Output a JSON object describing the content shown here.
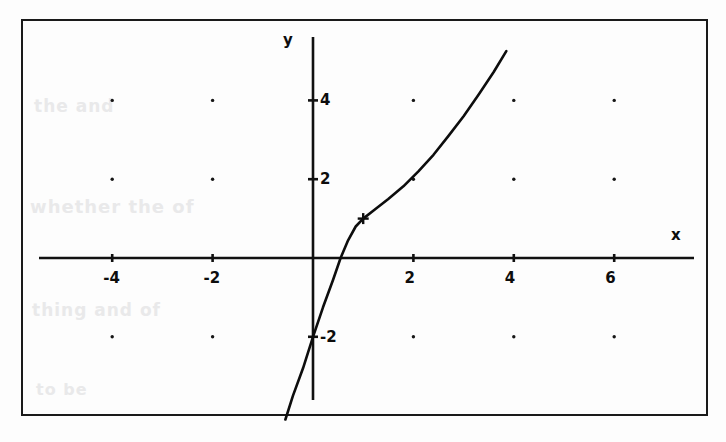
{
  "chart_data": {
    "type": "line",
    "title": "",
    "subtitle": "",
    "xlabel": "x",
    "ylabel": "y",
    "xlim": [
      -5.3,
      7.2
    ],
    "ylim": [
      -4.1,
      5.3
    ],
    "xticks": [
      -4,
      -2,
      2,
      4,
      6
    ],
    "yticks": [
      4,
      2,
      -2
    ],
    "xtick_labels": [
      "-4",
      "-2",
      "2",
      "4",
      "6"
    ],
    "ytick_labels": [
      "4",
      "2",
      "-2"
    ],
    "grid": "dots at even integer lattice points",
    "grid_dots_x": [
      -4,
      -2,
      2,
      4,
      6
    ],
    "grid_dots_y": [
      4,
      2,
      -2
    ],
    "legend": "none",
    "annotations": [
      {
        "label": "kink marker",
        "marker": "plus",
        "x": 1,
        "y": 1
      }
    ],
    "series": [
      {
        "name": "piecewise-curve",
        "description": "steep line from lower left through (0,-2), kink at (1,1), then upward bending curve exiting top near x=4",
        "points": [
          [
            -0.55,
            -4.1
          ],
          [
            -0.4,
            -3.5
          ],
          [
            -0.2,
            -2.8
          ],
          [
            0.0,
            -2.0
          ],
          [
            0.2,
            -1.25
          ],
          [
            0.4,
            -0.55
          ],
          [
            0.55,
            0.0
          ],
          [
            0.7,
            0.45
          ],
          [
            0.85,
            0.8
          ],
          [
            1.0,
            1.0
          ],
          [
            1.25,
            1.25
          ],
          [
            1.5,
            1.5
          ],
          [
            1.8,
            1.82
          ],
          [
            2.1,
            2.2
          ],
          [
            2.4,
            2.62
          ],
          [
            2.7,
            3.1
          ],
          [
            3.0,
            3.6
          ],
          [
            3.3,
            4.15
          ],
          [
            3.6,
            4.72
          ],
          [
            3.85,
            5.25
          ]
        ]
      }
    ]
  },
  "axes": {
    "x_axis_label": "x",
    "y_axis_label": "y"
  },
  "background_bleed": {
    "line1": "the and",
    "line2": "whether the of",
    "line3": "thing and of",
    "line4": "to be"
  }
}
